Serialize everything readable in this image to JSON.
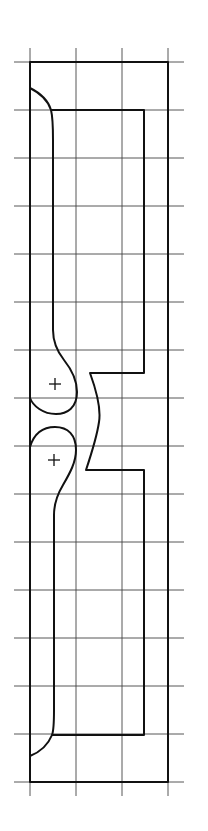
{
  "diagram": {
    "title": "",
    "grid": {
      "columns": 3,
      "rows": 15,
      "color": "#444444"
    },
    "shapes": [
      {
        "name": "outer-frame",
        "kind": "rectangle"
      },
      {
        "name": "inner-profile",
        "kind": "profile-with-notch"
      },
      {
        "name": "upper-lobe",
        "kind": "rounded-lobe"
      },
      {
        "name": "lower-lobe",
        "kind": "rounded-lobe"
      }
    ],
    "markers": [
      {
        "name": "upper-center-mark",
        "symbol": "+"
      },
      {
        "name": "lower-center-mark",
        "symbol": "+"
      }
    ],
    "line_color": "#111111"
  }
}
